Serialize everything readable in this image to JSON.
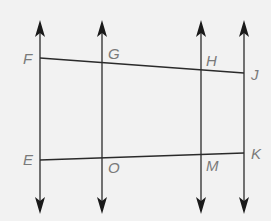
{
  "diagram": {
    "colors": {
      "background": "#f2f2f2",
      "line": "#2a2a2a",
      "label": "#7a7a7a"
    },
    "vertical_lines": [
      {
        "x": 40,
        "y_top": 20,
        "y_bottom": 214
      },
      {
        "x": 102,
        "y_top": 20,
        "y_bottom": 214
      },
      {
        "x": 201,
        "y_top": 20,
        "y_bottom": 214
      },
      {
        "x": 244,
        "y_top": 20,
        "y_bottom": 214
      }
    ],
    "transversals": [
      {
        "name": "FJ",
        "from": [
          40,
          58
        ],
        "to": [
          244,
          73
        ]
      },
      {
        "name": "EK",
        "from": [
          40,
          160
        ],
        "to": [
          244,
          153
        ]
      }
    ],
    "labels": {
      "F": "F",
      "G": "G",
      "H": "H",
      "J": "J",
      "E": "E",
      "O": "O",
      "M": "M",
      "K": "K"
    }
  }
}
